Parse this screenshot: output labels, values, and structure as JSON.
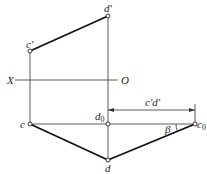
{
  "diagram": {
    "type": "orthographic-projection",
    "labels": {
      "d_prime": "d'",
      "c_prime": "c'",
      "axis_x": "X",
      "axis_o": "O",
      "c": "c",
      "d0": "d",
      "d0_sub": "0",
      "c0": "c",
      "c0_sub": "0",
      "d": "d",
      "dimension": "c'd'",
      "angle": "β"
    },
    "points": {
      "d_prime": [
        108,
        16
      ],
      "c_prime": [
        30,
        51
      ],
      "c": [
        30,
        124
      ],
      "d0": [
        108,
        124
      ],
      "c0": [
        195,
        124
      ],
      "d": [
        108,
        160
      ]
    },
    "colors": {
      "line": "#222222",
      "background": "#ffffff"
    }
  }
}
